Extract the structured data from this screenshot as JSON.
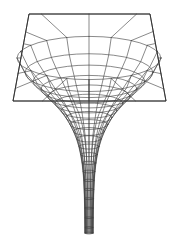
{
  "figure": {
    "title": "Gravity Well Embedding Diagram",
    "background_color": "#ffffff",
    "line_color": "#3a3a3a",
    "edge_color": "#2b2b2b",
    "width": 178,
    "height": 236,
    "render_style": "wireframe-line-drawing"
  },
  "geometry": {
    "center_x": 89.0,
    "center_y": 58.0,
    "plane": {
      "name": "flat-sheet-quadrilateral",
      "corners": [
        {
          "x": 29.0,
          "y": 14.0,
          "label": "top-left"
        },
        {
          "x": 150.0,
          "y": 14.0,
          "label": "top-right"
        },
        {
          "x": 166.0,
          "y": 101.0,
          "label": "bottom-right"
        },
        {
          "x": 13.0,
          "y": 101.0,
          "label": "bottom-left"
        }
      ]
    },
    "spoke_count": 20,
    "ring_count": 22,
    "funnel": {
      "mouth_half_width": 72.0,
      "throat_half_width": 4.2,
      "top_y": 14.0,
      "plane_y": 101.0,
      "tip_y": 233.0,
      "perspective_tilt": 0.3
    },
    "profile": {
      "description": "paraboloid-like embedding r(z) with flared mouth and long narrow stem",
      "mouth_flare_exponent": 2.0,
      "stem_decay": 0.55
    }
  },
  "chart_data": {
    "type": "line",
    "title": "Gravity Well Embedding Diagram",
    "xlabel": "radial distance r",
    "ylabel": "embedding depth z",
    "grid": true,
    "legend": "none",
    "radial_profile": {
      "r": [
        72.0,
        64.0,
        56.0,
        48.0,
        41.0,
        34.0,
        28.0,
        23.0,
        19.0,
        15.5,
        12.5,
        10.2,
        8.4,
        7.0,
        6.0,
        5.3,
        4.9,
        4.6,
        4.4,
        4.3,
        4.2,
        4.2
      ],
      "z": [
        0.0,
        4.0,
        8.5,
        13.5,
        19.0,
        25.0,
        31.5,
        38.5,
        46.0,
        54.0,
        63.0,
        73.0,
        84.0,
        96.0,
        109.0,
        123.0,
        138.0,
        154.0,
        171.0,
        189.0,
        208.0,
        219.0
      ]
    }
  }
}
